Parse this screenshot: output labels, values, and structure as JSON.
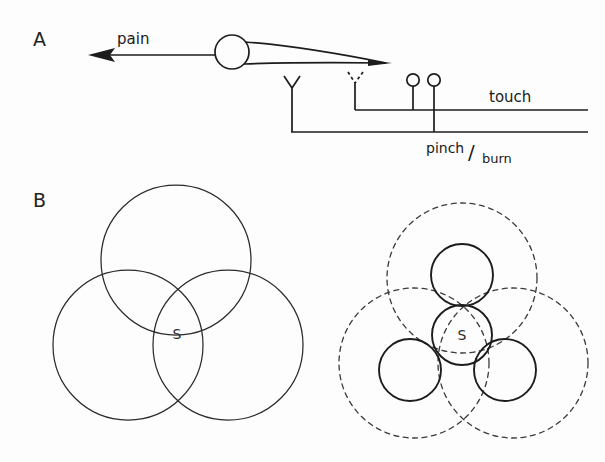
{
  "figure": {
    "background_color": "#fdfdfd",
    "ink_color": "#1c1c1c",
    "panels": [
      {
        "id": "A",
        "letter": "A",
        "x": 33,
        "y": 46
      },
      {
        "id": "B",
        "letter": "B",
        "x": 33,
        "y": 207
      }
    ]
  },
  "panel_a": {
    "letter": "A",
    "arrow_label": "pain",
    "labels": {
      "touch": "touch",
      "pinch_numerator": "pinch",
      "fraction_slash": "/",
      "burn_denominator": "burn"
    },
    "neuron": {
      "soma_center_x": 232,
      "soma_center_y": 52,
      "soma_radius": 17,
      "axon_tip_x": 386,
      "axon_tip_y": 63
    },
    "arrow": {
      "tail_x": 215,
      "head_x": 92,
      "y": 55
    },
    "receptors": [
      {
        "name": "free-nerve-ending-solid",
        "style": "solid",
        "x": 292,
        "tip_y": 76,
        "type": "y-fork"
      },
      {
        "name": "free-nerve-ending-dashed",
        "style": "dashed",
        "x": 355,
        "tip_y": 72,
        "type": "y-fork"
      },
      {
        "name": "encapsulated-ending-left",
        "style": "solid",
        "x": 413,
        "circle_y": 80,
        "type": "bulb"
      },
      {
        "name": "encapsulated-ending-right",
        "style": "solid",
        "x": 434,
        "circle_y": 80,
        "type": "bulb"
      }
    ],
    "afferent_lines": [
      {
        "name": "touch-line",
        "label": "touch",
        "y": 110,
        "x_start": 355,
        "x_end": 588
      },
      {
        "name": "pinch-burn-line",
        "label": "pinch/burn",
        "y": 132,
        "x_start": 292,
        "x_end": 588
      }
    ]
  },
  "panel_b": {
    "letter": "B",
    "left_diagram": {
      "name": "overlapping-receptive-fields",
      "center_label": "S",
      "circle_count": 3,
      "style": "solid",
      "radius": 75,
      "circles": [
        {
          "name": "field-top",
          "cx": 176,
          "cy": 260,
          "r": 75
        },
        {
          "name": "field-bottom-left",
          "cx": 128,
          "cy": 345,
          "r": 75
        },
        {
          "name": "field-bottom-right",
          "cx": 228,
          "cy": 345,
          "r": 75
        }
      ],
      "label_x": 177,
      "label_y": 339
    },
    "right_diagram": {
      "name": "convergent-receptive-fields",
      "center_label": "S",
      "large_circle_count": 3,
      "large_style": "dashed",
      "large_radius": 75,
      "large_circles": [
        {
          "name": "dashed-field-top",
          "cx": 462,
          "cy": 278,
          "r": 75
        },
        {
          "name": "dashed-field-bottom-left",
          "cx": 414,
          "cy": 363,
          "r": 75
        },
        {
          "name": "dashed-field-bottom-right",
          "cx": 513,
          "cy": 363,
          "r": 75
        }
      ],
      "small_circle_count": 4,
      "small_style": "solid",
      "small_radius": 30,
      "small_circles": [
        {
          "name": "unit-center",
          "cx": 462,
          "cy": 335,
          "r": 30,
          "label": "S"
        },
        {
          "name": "unit-top",
          "cx": 462,
          "cy": 275,
          "r": 31,
          "label": ""
        },
        {
          "name": "unit-bottom-left",
          "cx": 410,
          "cy": 370,
          "r": 31,
          "label": ""
        },
        {
          "name": "unit-bottom-right",
          "cx": 505,
          "cy": 370,
          "r": 31,
          "label": ""
        }
      ],
      "label_x": 462,
      "label_y": 340
    }
  }
}
